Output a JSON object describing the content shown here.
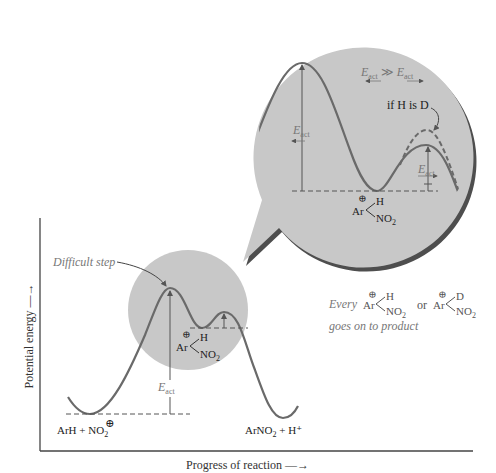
{
  "axes": {
    "y_label": "Potential energy —→",
    "x_label": "Progress of reaction —→"
  },
  "main_plot": {
    "difficult_step_label": "Difficult step",
    "eact_label": "E",
    "eact_sub": "act",
    "reactants_label": "ArH + NO",
    "reactants_sub": "2",
    "reactants_charge": "⊕",
    "products_label": "ArNO",
    "products_sub": "2",
    "products_tail": " + H⁺",
    "intermediate": {
      "charge": "⊕",
      "ar": "Ar",
      "top": "H",
      "bottom": "NO",
      "bottom_sub": "2"
    }
  },
  "zoom_bubble": {
    "comparison": {
      "left": "E",
      "left_sub": "act",
      "op": "≫",
      "right": "E",
      "right_sub": "act"
    },
    "eact_left": {
      "label": "E",
      "sub": "act"
    },
    "eact_right": {
      "label": "E",
      "sub": "act"
    },
    "deuterium_note": "if H is D",
    "intermediate": {
      "charge": "⊕",
      "ar": "Ar",
      "top": "H",
      "bottom": "NO",
      "bottom_sub": "2"
    }
  },
  "note": {
    "line1_prefix": "Every",
    "intermediate_h": {
      "charge": "⊕",
      "ar": "Ar",
      "top": "H",
      "bottom": "NO",
      "bottom_sub": "2"
    },
    "connector": "or",
    "intermediate_d": {
      "charge": "⊕",
      "ar": "Ar",
      "top": "D",
      "bottom": "NO",
      "bottom_sub": "2"
    },
    "line2": "goes on to product"
  },
  "colors": {
    "bubble_fill": "#c8c8c8",
    "bubble_shadow": "#4e4e4e",
    "curve": "#6a6a6a",
    "axis": "#444444",
    "dashed": "#555555"
  }
}
